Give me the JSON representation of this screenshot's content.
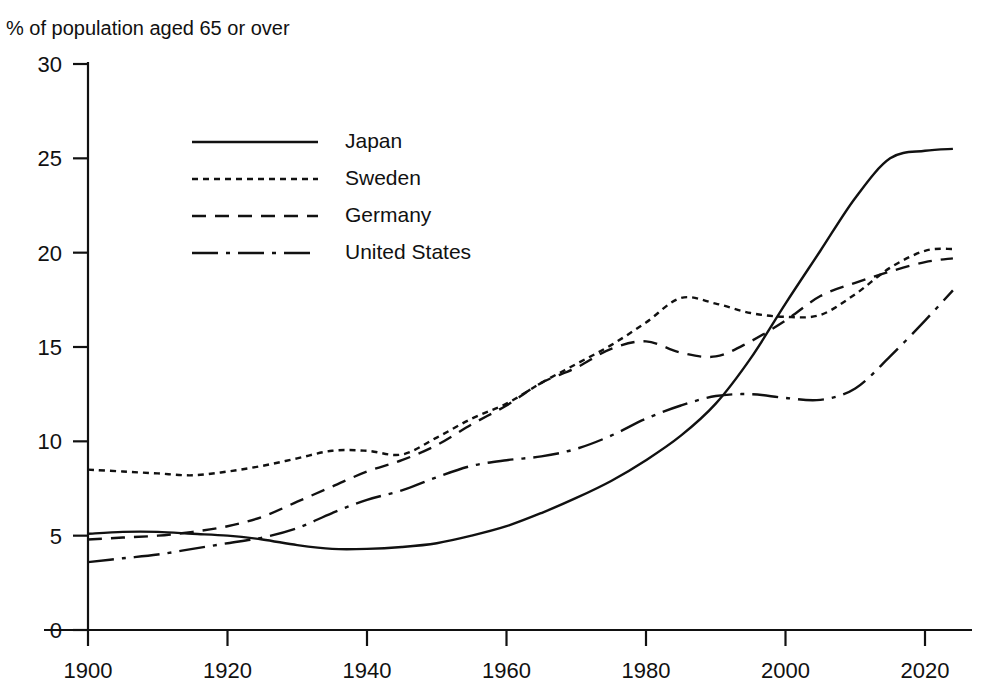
{
  "figure": {
    "subtitle": "% of population aged 65 or over",
    "title_remnant": ""
  },
  "chart_data": {
    "type": "line",
    "title": "",
    "subtitle": "% of population aged 65 or over",
    "xlabel": "",
    "ylabel": "% of population aged 65 or over",
    "xlim": [
      1898,
      2026
    ],
    "ylim": [
      0,
      30
    ],
    "xticks": [
      1900,
      1920,
      1940,
      1960,
      1980,
      2000,
      2020
    ],
    "yticks": [
      0,
      5,
      10,
      15,
      20,
      25,
      30
    ],
    "grid": false,
    "legend_position": "upper-left-inside",
    "x": [
      1900,
      1905,
      1910,
      1915,
      1920,
      1925,
      1930,
      1935,
      1940,
      1945,
      1950,
      1955,
      1960,
      1965,
      1970,
      1975,
      1980,
      1985,
      1990,
      1995,
      2000,
      2005,
      2010,
      2015,
      2020,
      2024
    ],
    "series": [
      {
        "name": "Japan",
        "line_style": "solid",
        "color": "#111111",
        "values": [
          5.1,
          5.2,
          5.2,
          5.1,
          5.0,
          4.8,
          4.5,
          4.3,
          4.3,
          4.4,
          4.6,
          5.0,
          5.5,
          6.2,
          7.0,
          7.9,
          9.0,
          10.3,
          12.0,
          14.4,
          17.3,
          20.1,
          22.9,
          25.0,
          25.4,
          25.5
        ]
      },
      {
        "name": "Sweden",
        "line_style": "dotted",
        "color": "#111111",
        "values": [
          8.5,
          8.4,
          8.3,
          8.2,
          8.4,
          8.7,
          9.1,
          9.5,
          9.5,
          9.3,
          10.2,
          11.2,
          12.0,
          13.1,
          14.1,
          15.1,
          16.3,
          17.6,
          17.3,
          16.8,
          16.6,
          16.7,
          17.8,
          19.2,
          20.1,
          20.2
        ]
      },
      {
        "name": "Germany",
        "line_style": "dashed",
        "color": "#111111",
        "values": [
          4.8,
          4.9,
          5.0,
          5.2,
          5.5,
          6.0,
          6.8,
          7.6,
          8.4,
          9.0,
          9.8,
          10.9,
          11.9,
          13.1,
          13.9,
          14.9,
          15.3,
          14.7,
          14.5,
          15.3,
          16.4,
          17.7,
          18.4,
          19.0,
          19.5,
          19.7
        ]
      },
      {
        "name": "United States",
        "line_style": "dashdot",
        "color": "#111111",
        "values": [
          3.6,
          3.8,
          4.0,
          4.3,
          4.6,
          4.9,
          5.4,
          6.2,
          6.9,
          7.4,
          8.1,
          8.7,
          9.0,
          9.2,
          9.6,
          10.3,
          11.2,
          11.9,
          12.4,
          12.5,
          12.3,
          12.2,
          12.8,
          14.5,
          16.4,
          18.0
        ]
      }
    ]
  },
  "legend": {
    "items": [
      {
        "label": "Japan",
        "style": "solid"
      },
      {
        "label": "Sweden",
        "style": "dotted"
      },
      {
        "label": "Germany",
        "style": "dashed"
      },
      {
        "label": "United States",
        "style": "dashdot"
      }
    ]
  }
}
